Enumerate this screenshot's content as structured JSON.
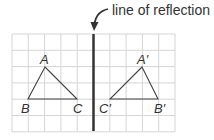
{
  "annotation": {
    "text": "line of reflection"
  },
  "grid": {
    "x0": 12,
    "y0": 34,
    "cols": 10,
    "rows": 6,
    "cell": 16.3,
    "line_color": "#d6d6d6",
    "axis_col": 5
  },
  "colors": {
    "axis": "#333333",
    "triangle": "#444444",
    "text": "#333333"
  },
  "triangle_original": {
    "labels": {
      "A": "A",
      "B": "B",
      "C": "C"
    }
  },
  "triangle_image": {
    "labels": {
      "A": "A′",
      "B": "B′",
      "C": "C′"
    }
  }
}
